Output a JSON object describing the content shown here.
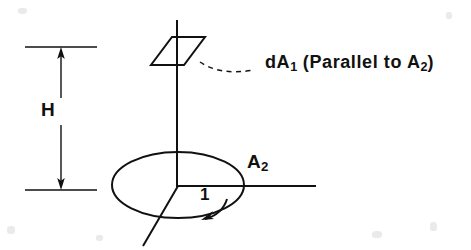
{
  "figure": {
    "kind": "engineering-geometry-diagram",
    "background_color": "#ffffff",
    "ink_color": "#111111",
    "width": 471,
    "height": 250,
    "labels": {
      "height_dimension": "H",
      "differential_area_prefix": "dA",
      "differential_area_subscript": "1",
      "differential_area_note": " (Parallel to A",
      "differential_area_note_subscript": "2",
      "differential_area_note_close": ")",
      "base_area_prefix": "A",
      "base_area_subscript": "2",
      "angle": "1"
    },
    "elements": {
      "vertical_axis": "vertical-center-axis",
      "horizontal_axis": "horizontal-base-axis",
      "base_ellipse": "base-area-ellipse",
      "element_parallelogram": "differential-area-parallelogram",
      "leader": "dashed-leader-line",
      "dimension": "height-dimension-arrow",
      "angle_arc": "angle-arc-arrow",
      "radial_ray": "radial-ray"
    }
  },
  "geometry": {
    "center": {
      "x": 178,
      "y": 186
    },
    "ellipse": {
      "cx": 178,
      "cy": 185,
      "rx": 66,
      "ry": 33
    },
    "parallelogram_points": "172,37 205,37 184,65 151,65",
    "vertical_axis": {
      "x": 177,
      "y_top": 20,
      "y_bottom": 186
    },
    "horizontal_axis": {
      "x_start": 178,
      "x_end": 316,
      "y": 186
    },
    "radial_ray": {
      "x1": 178,
      "y1": 186,
      "x2": 143,
      "y2": 246
    },
    "dimension": {
      "x": 61,
      "y_top": 47,
      "y_bottom": 190,
      "ext_x1": 25,
      "ext_x2": 97
    },
    "leader_path": "M 201,61 C 214,70 232,73 253,70"
  }
}
